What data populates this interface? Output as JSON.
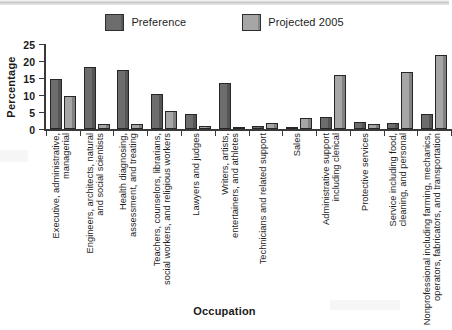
{
  "chart_data": {
    "type": "bar",
    "title": "",
    "xlabel": "Occupation",
    "ylabel": "Percentage",
    "ylim": [
      0,
      25
    ],
    "yticks": [
      0,
      5,
      10,
      15,
      20,
      25
    ],
    "grid": false,
    "legend_position": "top-center",
    "categories": [
      "Executive, administrative, managerial",
      "Engineers, architects, natural and social scientists",
      "Health diagnosing, assessment, and treating",
      "Teachers, counselors, librarians, social workers, and religious workers",
      "Lawyers and judges",
      "Writers, artists, entertainers, and athletes",
      "Technicians and related support",
      "Sales",
      "Administrative support including clerical",
      "Protective services",
      "Service including food, cleaning, and personal",
      "Nonprofessional including farming, mechanics, operators, fabricators, and transportation"
    ],
    "category_lines": [
      [
        "Executive, administrative,",
        "managerial"
      ],
      [
        "Engineers, architects, natural",
        "and social scientists"
      ],
      [
        "Health diagnosing,",
        "assessment, and treating"
      ],
      [
        "Teachers, counselors, librarians,",
        "social workers, and religious workers"
      ],
      [
        "Lawyers and judges",
        ""
      ],
      [
        "Writers, artists,",
        "entertainers, and athletes"
      ],
      [
        "Technicians and related support",
        ""
      ],
      [
        "Sales",
        ""
      ],
      [
        "Administrative support",
        "including clerical"
      ],
      [
        "Protective services",
        ""
      ],
      [
        "Service including food,",
        "cleaning, and personal"
      ],
      [
        "Nonprofessional including farming, mechanics,",
        "operators, fabricators, and transportation"
      ]
    ],
    "series": [
      {
        "name": "Preference",
        "color": "#6d6d6d",
        "values": [
          14.8,
          18.2,
          17.4,
          10.3,
          4.3,
          13.6,
          0.8,
          0.3,
          3.5,
          2.0,
          1.8,
          4.5
        ]
      },
      {
        "name": "Projected 2005",
        "color": "#a6a6a6",
        "values": [
          9.8,
          1.5,
          1.4,
          5.2,
          0.8,
          0.5,
          1.8,
          3.1,
          15.8,
          1.4,
          16.8,
          21.7
        ]
      }
    ]
  },
  "legend": {
    "entries": [
      {
        "label": "Preference",
        "color": "#6d6d6d"
      },
      {
        "label": "Projected 2005",
        "color": "#a6a6a6"
      }
    ]
  },
  "axes": {
    "y_title": "Percentage",
    "x_title": "Occupation",
    "y_tick_labels": [
      "0",
      "5",
      "10",
      "15",
      "20",
      "25"
    ]
  }
}
